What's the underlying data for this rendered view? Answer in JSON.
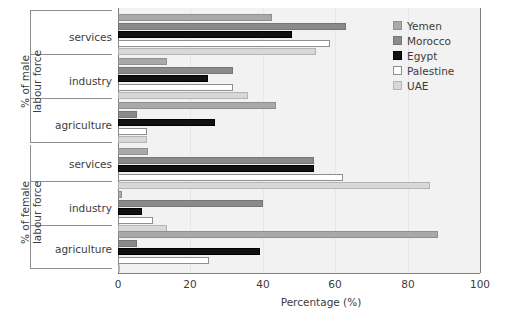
{
  "chart_data": {
    "type": "bar",
    "orientation": "horizontal",
    "title": "",
    "xlabel": "Percentage (%)",
    "ylabel": "",
    "xlim": [
      0,
      100
    ],
    "xticks": [
      0,
      20,
      40,
      60,
      80,
      100
    ],
    "grid": false,
    "legend_position": "top-right",
    "legend": [
      "Yemen",
      "Morocco",
      "Egypt",
      "Palestine",
      "UAE"
    ],
    "series_colors": {
      "Yemen": "#a9a9a9",
      "Morocco": "#8a8a8a",
      "Egypt": "#111111",
      "Palestine": "#ffffff",
      "UAE": "#d8d8d8"
    },
    "panels": [
      {
        "label": "% of male\nlabour force",
        "label_line1": "% of male",
        "label_line2": "labour force",
        "categories": [
          "services",
          "industry",
          "agriculture"
        ],
        "series": [
          {
            "name": "Yemen",
            "values": [
              42.6,
              13.5,
              43.7
            ]
          },
          {
            "name": "Morocco",
            "values": [
              63.0,
              31.8,
              5.3
            ]
          },
          {
            "name": "Egypt",
            "values": [
              48.0,
              25.0,
              26.8
            ]
          },
          {
            "name": "Palestine",
            "values": [
              58.7,
              31.8,
              8.0
            ]
          },
          {
            "name": "UAE",
            "values": [
              54.8,
              36.0,
              8.0
            ]
          }
        ]
      },
      {
        "label": "% of female\nlabour force",
        "label_line1": "% of female",
        "label_line2": "labour force",
        "categories": [
          "services",
          "industry",
          "agriculture"
        ],
        "series": [
          {
            "name": "Yemen",
            "values": [
              8.3,
              1.0,
              88.6
            ]
          },
          {
            "name": "Morocco",
            "values": [
              54.3,
              40.0,
              5.3
            ]
          },
          {
            "name": "Egypt",
            "values": [
              54.3,
              6.6,
              39.3
            ]
          },
          {
            "name": "Palestine",
            "values": [
              62.3,
              9.6,
              25.2
            ]
          },
          {
            "name": "UAE",
            "values": [
              86.4,
              13.5,
              0.4
            ]
          }
        ]
      }
    ]
  },
  "axis": {
    "tick_0": "0",
    "tick_20": "20",
    "tick_40": "40",
    "tick_60": "60",
    "tick_80": "80",
    "tick_100": "100",
    "xlabel": "Percentage (%)"
  },
  "panel1": {
    "line1": "% of male",
    "line2": "labour force",
    "cat_services": "services",
    "cat_industry": "industry",
    "cat_agriculture": "agriculture"
  },
  "panel2": {
    "line1": "% of female",
    "line2": "labour force",
    "cat_services": "services",
    "cat_industry": "industry",
    "cat_agriculture": "agriculture"
  },
  "legend": {
    "yemen": "Yemen",
    "morocco": "Morocco",
    "egypt": "Egypt",
    "palestine": "Palestine",
    "uae": "UAE"
  }
}
